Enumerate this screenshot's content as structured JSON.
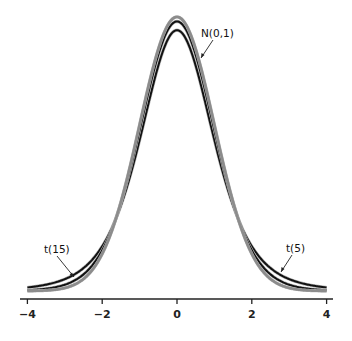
{
  "chart_data": {
    "type": "line",
    "title": "",
    "xlabel": "",
    "ylabel": "",
    "xlim": [
      -4,
      4
    ],
    "ylim": [
      0,
      0.4
    ],
    "x_ticks": [
      -4,
      -2,
      0,
      2,
      4
    ],
    "x_tick_labels": [
      "−4",
      "−2",
      "0",
      "2",
      "4"
    ],
    "grid": false,
    "legend": "none (curves labeled by annotations)",
    "series": [
      {
        "name": "N(0,1)",
        "distribution": "normal",
        "df": null,
        "color": "#8c8c8c",
        "peak": 0.399
      },
      {
        "name": "t(15)",
        "distribution": "t",
        "df": 15,
        "color": "#111111",
        "peak": 0.392
      },
      {
        "name": "t(5)",
        "distribution": "t",
        "df": 5,
        "color": "#111111",
        "peak": 0.38
      }
    ],
    "annotations": [
      {
        "text": "N(0,1)",
        "points_to": "N(0,1) curve near x=0.6"
      },
      {
        "text": "t(15)",
        "points_to": "t(15) curve near x=-2.8"
      },
      {
        "text": "t(5)",
        "points_to": "t(5) curve near x=2.8"
      }
    ]
  },
  "labels": {
    "normal": "N(0,1)",
    "t15": "t(15)",
    "t5": "t(5)"
  }
}
